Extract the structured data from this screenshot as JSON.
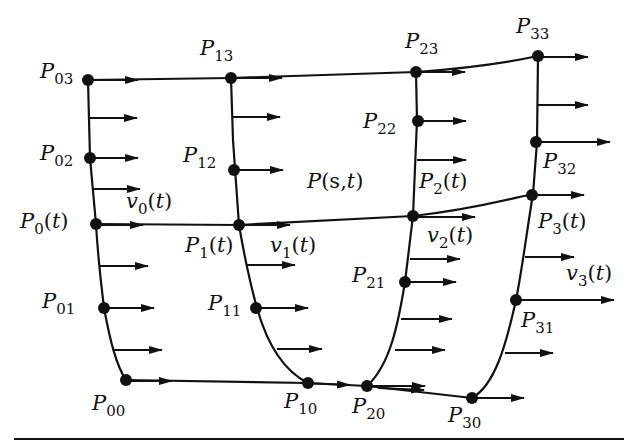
{
  "diagram": {
    "surface_label": {
      "base": "P",
      "arg_s": "s",
      "arg_t": "t"
    },
    "control_points": [
      {
        "id": "P00",
        "base": "P",
        "sub": "00"
      },
      {
        "id": "P01",
        "base": "P",
        "sub": "01"
      },
      {
        "id": "P02",
        "base": "P",
        "sub": "02"
      },
      {
        "id": "P03",
        "base": "P",
        "sub": "03"
      },
      {
        "id": "P10",
        "base": "P",
        "sub": "10"
      },
      {
        "id": "P11",
        "base": "P",
        "sub": "11"
      },
      {
        "id": "P12",
        "base": "P",
        "sub": "12"
      },
      {
        "id": "P13",
        "base": "P",
        "sub": "13"
      },
      {
        "id": "P20",
        "base": "P",
        "sub": "20"
      },
      {
        "id": "P21",
        "base": "P",
        "sub": "21"
      },
      {
        "id": "P22",
        "base": "P",
        "sub": "22"
      },
      {
        "id": "P23",
        "base": "P",
        "sub": "23"
      },
      {
        "id": "P30",
        "base": "P",
        "sub": "30"
      },
      {
        "id": "P31",
        "base": "P",
        "sub": "31"
      },
      {
        "id": "P32",
        "base": "P",
        "sub": "32"
      },
      {
        "id": "P33",
        "base": "P",
        "sub": "33"
      }
    ],
    "curve_points": [
      {
        "id": "P0t",
        "base": "P",
        "sub": "0",
        "arg": "t"
      },
      {
        "id": "P1t",
        "base": "P",
        "sub": "1",
        "arg": "t"
      },
      {
        "id": "P2t",
        "base": "P",
        "sub": "2",
        "arg": "t"
      },
      {
        "id": "P3t",
        "base": "P",
        "sub": "3",
        "arg": "t"
      }
    ],
    "tangent_vectors": [
      {
        "id": "v0t",
        "base": "v",
        "sub": "0",
        "arg": "t"
      },
      {
        "id": "v1t",
        "base": "v",
        "sub": "1",
        "arg": "t"
      },
      {
        "id": "v2t",
        "base": "v",
        "sub": "2",
        "arg": "t"
      },
      {
        "id": "v3t",
        "base": "v",
        "sub": "3",
        "arg": "t"
      }
    ],
    "paren_open": "(",
    "paren_close": ")",
    "comma": ","
  }
}
